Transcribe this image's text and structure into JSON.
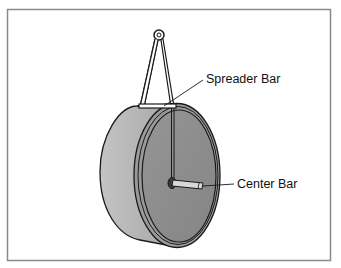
{
  "figure": {
    "labels": {
      "spreader_bar": "Spreader Bar",
      "center_bar": "Center Bar"
    },
    "colors": {
      "frame": "#8a8a8a",
      "drum_side": "#b5b5b5",
      "drum_face": "#8e8e8e",
      "outline": "#1a1a1a",
      "center_bar": "#d8d8d8"
    }
  }
}
